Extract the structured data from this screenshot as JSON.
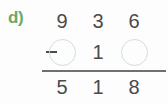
{
  "problem": {
    "label": "d)",
    "operator": "−",
    "operator_name": "minus-sign",
    "label_color": "#6aa86e",
    "digit_color": "#4a4a4a",
    "circle_color": "#cfe0cf",
    "rule_color": "#6f6f6f",
    "minuend": {
      "name": "minuend",
      "cells": [
        {
          "type": "digit",
          "value": "9"
        },
        {
          "type": "digit",
          "value": "3"
        },
        {
          "type": "digit",
          "value": "6"
        }
      ]
    },
    "subtrahend": {
      "name": "subtrahend",
      "cells": [
        {
          "type": "blank",
          "value": ""
        },
        {
          "type": "digit",
          "value": "1"
        },
        {
          "type": "blank",
          "value": ""
        }
      ]
    },
    "difference": {
      "name": "difference",
      "cells": [
        {
          "type": "digit",
          "value": "5"
        },
        {
          "type": "digit",
          "value": "1"
        },
        {
          "type": "digit",
          "value": "8"
        }
      ]
    }
  }
}
